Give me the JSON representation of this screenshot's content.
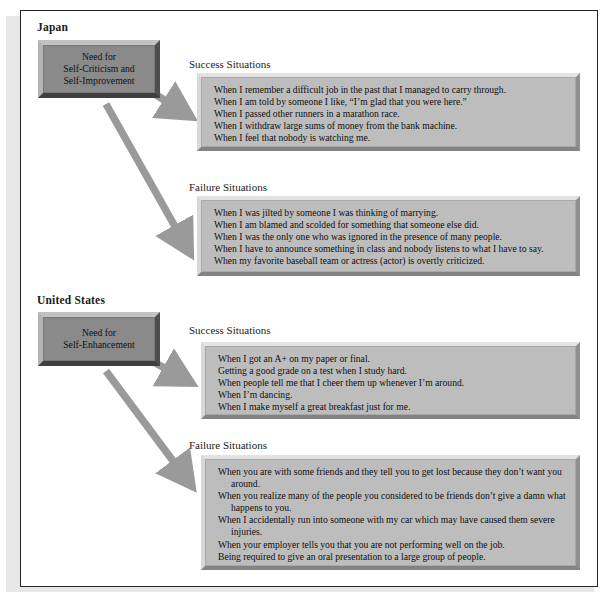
{
  "figure": {
    "sections": [
      {
        "country": "Japan",
        "concept": {
          "lines": [
            "Need for",
            "Self-Criticism and",
            "Self-Improvement"
          ]
        },
        "groups": [
          {
            "heading": "Success Situations",
            "items": [
              "When I remember a difficult job in the past that I managed to carry through.",
              "When I am told by someone I like, “I’m glad that you were here.”",
              "When I passed other runners in a marathon race.",
              "When I withdraw large sums of money from the bank machine.",
              "When I feel that nobody is watching me."
            ]
          },
          {
            "heading": "Failure Situations",
            "items": [
              "When I was jilted by someone I was thinking of marrying.",
              "When I am blamed and scolded for something that someone else did.",
              "When I was the only one who was ignored in the presence of many people.",
              "When I have to announce something in class and nobody listens to what I have to say.",
              "When my favorite baseball team or actress (actor) is overtly criticized."
            ]
          }
        ]
      },
      {
        "country": "United States",
        "concept": {
          "lines": [
            "Need for",
            "Self-Enhancement"
          ]
        },
        "groups": [
          {
            "heading": "Success Situations",
            "items": [
              "When I got an A+ on my paper or final.",
              "Getting a good grade on a test when I study hard.",
              "When people tell me that I cheer them up whenever I’m around.",
              "When I’m dancing.",
              "When I make myself a great breakfast just for me."
            ]
          },
          {
            "heading": "Failure Situations",
            "items": [
              "When you are with some friends and they tell you to get lost because they don’t want you around.",
              "When you realize many of the people you considered to be friends don’t give a damn what happens to you.",
              "When I accidentally run into someone with my car which may have caused them severe injuries.",
              "When your employer tells you that you are not performing well on the job.",
              "Being required to give an oral presentation to a large group of people."
            ]
          }
        ]
      }
    ],
    "arrows": [
      {
        "name": "japan-to-success",
        "from": "japan-concept-box",
        "to": "japan-success-box"
      },
      {
        "name": "japan-to-failure",
        "from": "japan-concept-box",
        "to": "japan-failure-box"
      },
      {
        "name": "us-to-success",
        "from": "us-concept-box",
        "to": "us-success-box"
      },
      {
        "name": "us-to-failure",
        "from": "us-concept-box",
        "to": "us-failure-box"
      }
    ],
    "colors": {
      "frame": "#262626",
      "page": "#ffffff",
      "concept_box_fill": "#8a8a8a",
      "list_box_fill": "#bdbdbd",
      "arrow": "#9a9a9a",
      "text": "#0f0f0f"
    }
  }
}
